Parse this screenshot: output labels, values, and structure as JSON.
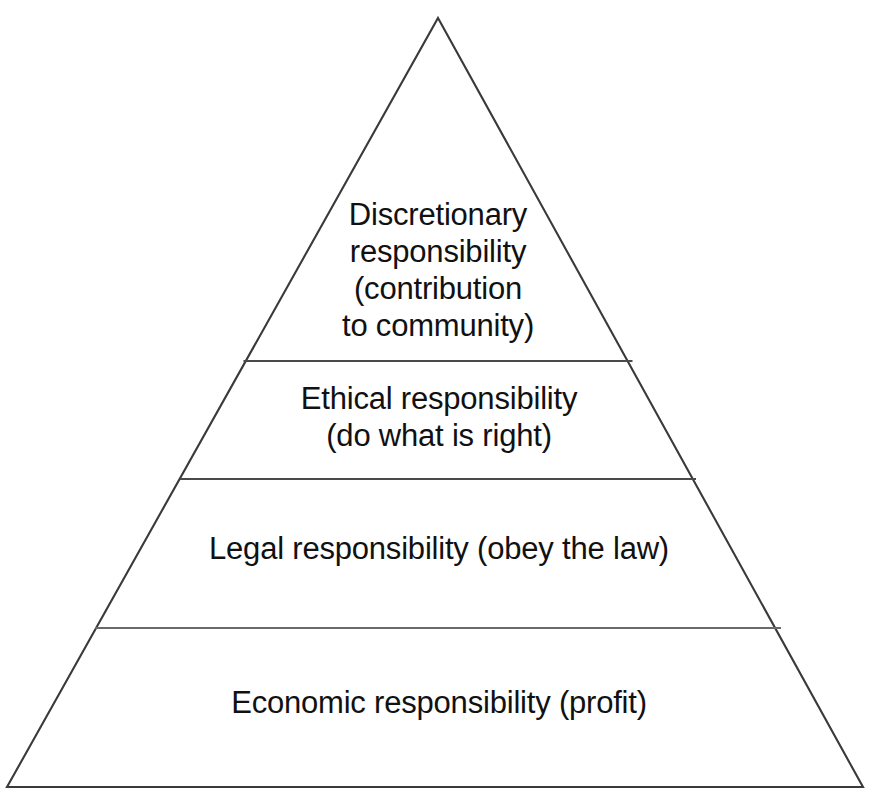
{
  "diagram": {
    "type": "pyramid",
    "background_color": "#ffffff",
    "outline_color": "#3a3a3a",
    "divider_color": "#555555",
    "text_color": "#111111",
    "tier_count": 4,
    "tiers": [
      {
        "id": "discretionary",
        "rank": 1,
        "position": "top",
        "label": "Discretionary\nresponsibility\n(contribution\nto community)",
        "heading": "Discretionary responsibility",
        "parenthetical": "contribution to community"
      },
      {
        "id": "ethical",
        "rank": 2,
        "position": "upper-middle",
        "label": "Ethical responsibility\n(do what is right)",
        "heading": "Ethical responsibility",
        "parenthetical": "do what is right"
      },
      {
        "id": "legal",
        "rank": 3,
        "position": "lower-middle",
        "label": "Legal responsibility (obey the law)",
        "heading": "Legal responsibility",
        "parenthetical": "obey the law"
      },
      {
        "id": "economic",
        "rank": 4,
        "position": "base",
        "label": "Economic responsibility (profit)",
        "heading": "Economic responsibility",
        "parenthetical": "profit"
      }
    ],
    "geometry": {
      "apex": [
        438,
        18
      ],
      "base_left": [
        7,
        787
      ],
      "base_right": [
        863,
        787
      ],
      "dividers_y": [
        361,
        479,
        628
      ]
    }
  }
}
